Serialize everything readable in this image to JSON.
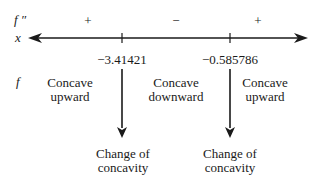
{
  "row_labels": {
    "second_derivative": "f ″",
    "variable": "x",
    "function": "f"
  },
  "sign_chart": {
    "signs": [
      "+",
      "−",
      "+"
    ],
    "critical_points": [
      "−3.41421",
      "−0.585786"
    ],
    "intervals": [
      {
        "line1": "Concave",
        "line2": "upward"
      },
      {
        "line1": "Concave",
        "line2": "downward"
      },
      {
        "line1": "Concave",
        "line2": "upward"
      }
    ],
    "annotations": [
      {
        "line1": "Change of",
        "line2": "concavity"
      },
      {
        "line1": "Change of",
        "line2": "concavity"
      }
    ]
  }
}
